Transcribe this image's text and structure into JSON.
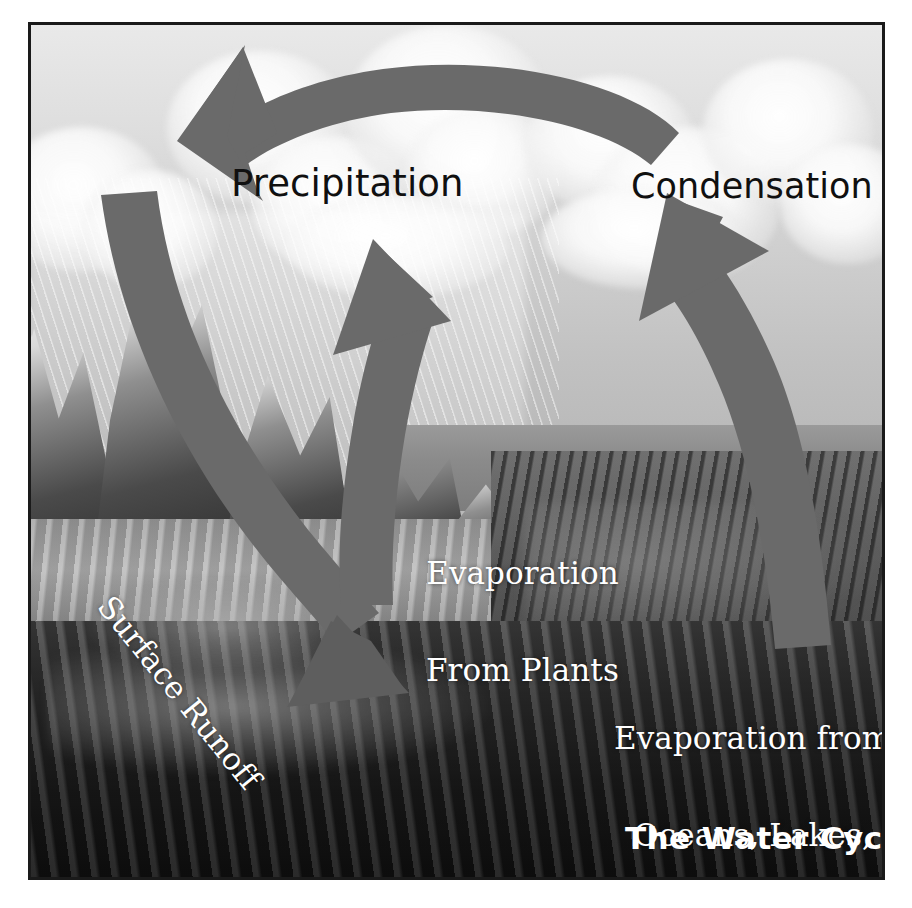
{
  "figure": {
    "title": "The Water Cycle",
    "type": "labeled-illustration-diagram",
    "frame": {
      "border_color": "#1a1a1a",
      "background_color": "#ffffff"
    }
  },
  "palette": {
    "arrow_gray": "#6a6a6a",
    "arrow_gray_dark": "#5e5e5e",
    "label_dark": "#101010",
    "label_light": "#ffffff",
    "sky_light": "#e9e9e9",
    "sky_mid": "#c2c2c2",
    "ocean_dark": "#1d1d1d",
    "ground_dark": "#121212",
    "border": "#1a1a1a"
  },
  "labels": [
    {
      "id": "precipitation",
      "text": "Precipitation",
      "color": "dark",
      "position": "upper-left sky over clouds"
    },
    {
      "id": "condensation",
      "text": "Condensation",
      "color": "dark",
      "position": "upper-right sky over clouds"
    },
    {
      "id": "evaporation-from-plants",
      "line1": "Evaporation",
      "line2": "From Plants",
      "color": "light",
      "position": "center, over the valley"
    },
    {
      "id": "evaporation-from-oceans",
      "line1": "Evaporation from",
      "line2": "Oceans, Lakes,",
      "line3": "and Streams",
      "color": "light",
      "position": "lower-right, over the ocean"
    },
    {
      "id": "surface-runoff",
      "text": "Surface Runoff",
      "color": "light",
      "rotation_deg": 51,
      "position": "left mountainside, rotated down-right"
    },
    {
      "id": "title",
      "text": "The Water Cycle",
      "color": "light",
      "position": "bottom-right corner"
    }
  ],
  "arrows": [
    {
      "id": "precipitation-arrow",
      "name": "top curved arrow pointing left",
      "from": "condensation (upper right)",
      "to": "precipitation (upper left)",
      "direction": "left"
    },
    {
      "id": "surface-runoff-arrow",
      "name": "left curved arrow descending to the valley",
      "from": "clouds over mountains",
      "to": "valley floor",
      "direction": "down-right"
    },
    {
      "id": "evaporation-plants-arrow",
      "name": "center arrow rising from the land",
      "from": "valley / plants",
      "to": "clouds",
      "direction": "up-left"
    },
    {
      "id": "evaporation-ocean-arrow",
      "name": "right curved arrow rising from the ocean",
      "from": "ocean surface",
      "to": "condensation clouds",
      "direction": "up-left"
    }
  ],
  "scene_elements": [
    {
      "id": "clouds",
      "label": "cloud bank across the sky"
    },
    {
      "id": "rain",
      "label": "rain streaks falling on the mountains"
    },
    {
      "id": "mountains",
      "label": "snow-capped mountain range at left"
    },
    {
      "id": "valley",
      "label": "streams and lakes in the valley"
    },
    {
      "id": "ocean",
      "label": "ocean at lower right"
    },
    {
      "id": "ground",
      "label": "dark rocky foreground"
    }
  ]
}
